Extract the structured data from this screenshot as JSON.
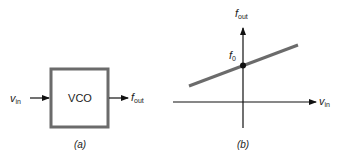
{
  "panel_a": {
    "caption": "(a)",
    "block_label": "VCO",
    "input_label": "v",
    "input_sub": "in",
    "output_label": "f",
    "output_sub": "out"
  },
  "panel_b": {
    "caption": "(b)",
    "y_axis_label": "f",
    "y_axis_sub": "out",
    "x_axis_label": "v",
    "x_axis_sub": "in",
    "intercept_label": "f",
    "intercept_sub": "0"
  },
  "colors": {
    "block_border": "#6b6b6b",
    "line": "#6b6b6b",
    "axes": "#111111"
  }
}
